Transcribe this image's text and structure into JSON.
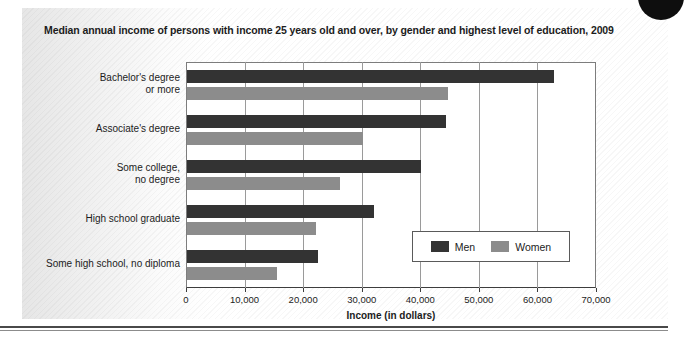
{
  "title": "Median annual income of persons with income 25 years old and over, by gender and highest level of education, 2009",
  "legend": {
    "men_label": "Men",
    "women_label": "Women"
  },
  "colors": {
    "men": "#333333",
    "women": "#8c8c8c",
    "grid": "#9a9a9a",
    "axis": "#3d3d3d"
  },
  "chart_data": {
    "type": "bar",
    "orientation": "horizontal",
    "title": "Median annual income of persons with income 25 years old and over, by gender and highest level of education, 2009",
    "xlabel": "Income (in dollars)",
    "ylabel": "",
    "xlim": [
      0,
      70000
    ],
    "xticks": [
      0,
      10000,
      20000,
      30000,
      40000,
      50000,
      60000,
      70000
    ],
    "xtick_labels": [
      "0",
      "10,000",
      "20,000",
      "30,000",
      "40,000",
      "50,000",
      "60,000",
      "70,000"
    ],
    "grid": true,
    "legend_position": "inside-lower-right",
    "categories": [
      "Bachelor's degree\nor more",
      "Associate's degree",
      "Some college,\nno degree",
      "High school graduate",
      "Some high school, no diploma"
    ],
    "series": [
      {
        "name": "Men",
        "color": "#333333",
        "values": [
          62700,
          44300,
          40000,
          32000,
          22400
        ]
      },
      {
        "name": "Women",
        "color": "#8c8c8c",
        "values": [
          44500,
          30000,
          26200,
          22000,
          15300
        ]
      }
    ]
  }
}
